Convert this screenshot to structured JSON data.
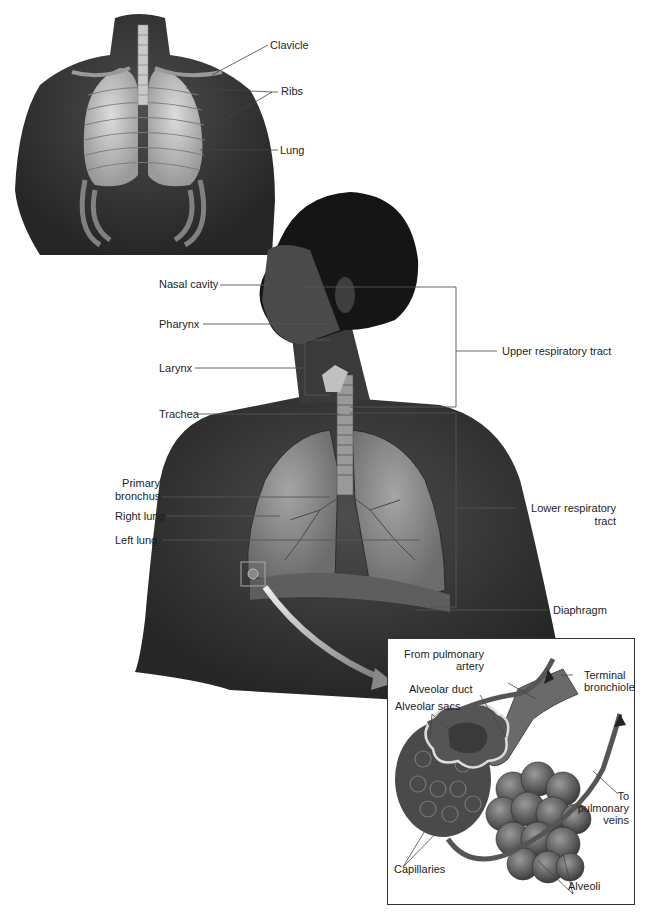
{
  "top_figure": {
    "labels": {
      "clavicle": "Clavicle",
      "ribs": "Ribs",
      "lung": "Lung"
    }
  },
  "main_figure": {
    "labels": {
      "nasal_cavity": "Nasal cavity",
      "pharynx": "Pharynx",
      "larynx": "Larynx",
      "trachea": "Trachea",
      "primary_bronchus_1": "Primary",
      "primary_bronchus_2": "bronchus",
      "right_lung": "Right lung",
      "left_lung": "Left lung",
      "upper_tract": "Upper respiratory tract",
      "lower_tract_1": "Lower respiratory",
      "lower_tract_2": "tract",
      "diaphragm": "Diaphragm"
    }
  },
  "inset_figure": {
    "labels": {
      "from_artery_1": "From pulmonary",
      "from_artery_2": "artery",
      "terminal_1": "Terminal",
      "terminal_2": "bronchiole",
      "alveolar_duct": "Alveolar duct",
      "alveolar_sacs": "Alveolar sacs",
      "to_veins_1": "To",
      "to_veins_2": "pulmonary",
      "to_veins_3": "veins",
      "capillaries": "Capillaries",
      "alveoli": "Alveoli"
    }
  },
  "colors": {
    "skin_dark": "#3a3a3a",
    "skin_mid": "#5a5a5a",
    "lung_gray": "#8e8e8e",
    "leader_line": "#555555",
    "bracket": "#666666"
  }
}
